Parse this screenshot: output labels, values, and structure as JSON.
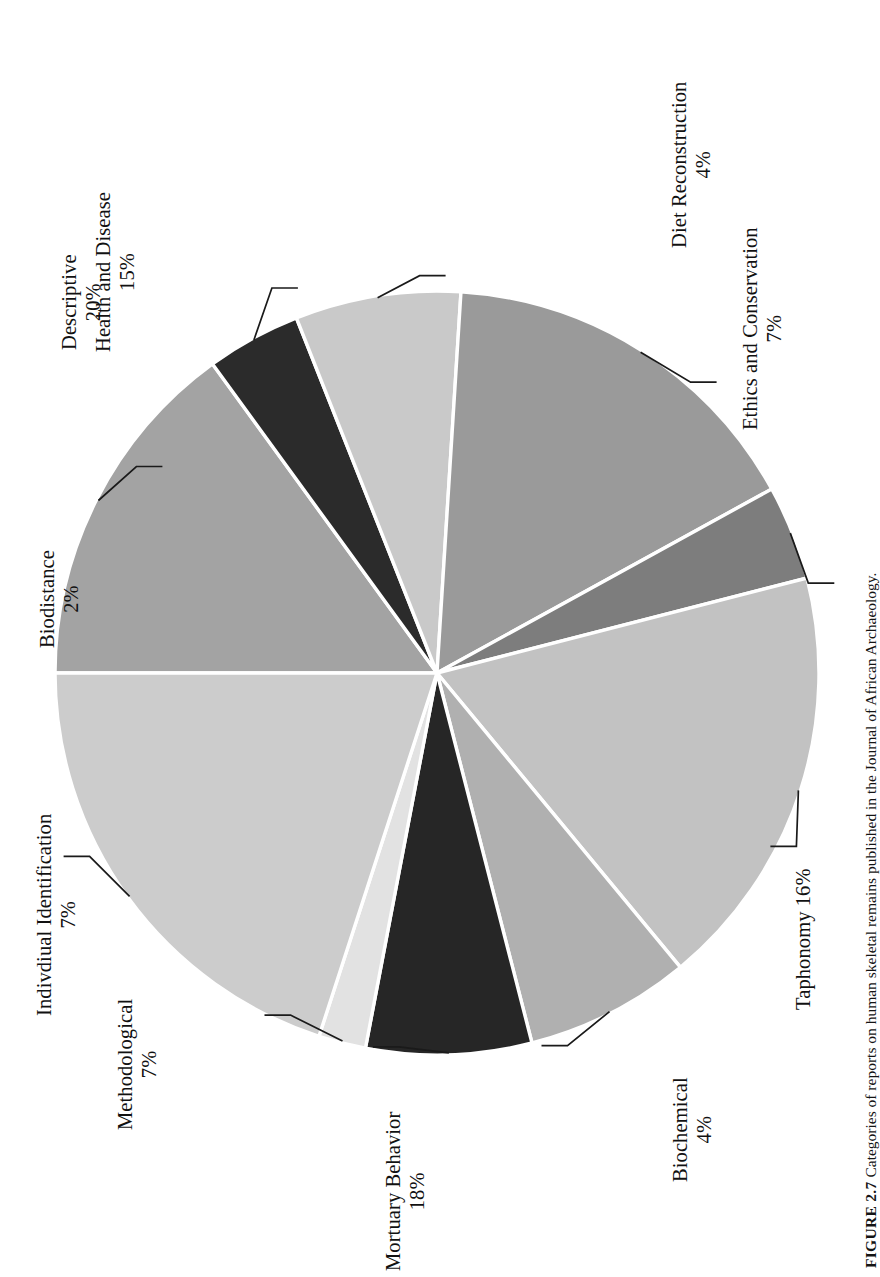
{
  "figure": {
    "caption_label": "FIGURE 2.7",
    "caption_text": "Categories of reports on human skeletal remains published in the Journal of African Archaeology."
  },
  "chart_data": {
    "type": "pie",
    "title": "",
    "orientation_degrees": -90,
    "separator_color": "#ffffff",
    "legend": "none (direct labels with leader lines)",
    "categories": [
      "Health and Disease",
      "Diet Reconstruction",
      "Ethics and Conservation",
      "Taphonomy",
      "Biochemical",
      "Mortuary Behavior",
      "Methodological",
      "Indivdiual Identification",
      "Biodistance",
      "Descriptive"
    ],
    "values": [
      15,
      4,
      7,
      16,
      4,
      18,
      7,
      7,
      2,
      20
    ],
    "value_labels": [
      "15%",
      "4%",
      "7%",
      "16%",
      "4%",
      "18%",
      "7%",
      "7%",
      "2%",
      "20%"
    ],
    "colors": [
      "#a3a3a3",
      "#2b2b2b",
      "#c9c9c9",
      "#9a9a9a",
      "#7d7d7d",
      "#c2c2c2",
      "#b0b0b0",
      "#262626",
      "#e2e2e2",
      "#cccccc"
    ],
    "slices": [
      {
        "label": "Health and Disease",
        "value": 15,
        "pct": "15%",
        "color": "#a3a3a3"
      },
      {
        "label": "Diet Reconstruction",
        "value": 4,
        "pct": "4%",
        "color": "#2b2b2b"
      },
      {
        "label": "Ethics and Conservation",
        "value": 7,
        "pct": "7%",
        "color": "#c9c9c9"
      },
      {
        "label": "Taphonomy",
        "value": 16,
        "pct": "16%",
        "color": "#9a9a9a"
      },
      {
        "label": "Biochemical",
        "value": 4,
        "pct": "4%",
        "color": "#7d7d7d"
      },
      {
        "label": "Mortuary Behavior",
        "value": 18,
        "pct": "18%",
        "color": "#c2c2c2"
      },
      {
        "label": "Methodological",
        "value": 7,
        "pct": "7%",
        "color": "#b0b0b0"
      },
      {
        "label": "Indivdiual Identification",
        "value": 7,
        "pct": "7%",
        "color": "#262626"
      },
      {
        "label": "Biodistance",
        "value": 2,
        "pct": "2%",
        "color": "#e2e2e2"
      },
      {
        "label": "Descriptive",
        "value": 20,
        "pct": "20%",
        "color": "#cccccc"
      }
    ],
    "total": 100
  },
  "labels": {
    "health": {
      "line1": "Health and Disease",
      "line2": "15%"
    },
    "diet": {
      "line1": "Diet Reconstruction",
      "line2": "4%"
    },
    "ethics": {
      "line1": "Ethics and Conservation",
      "line2": "7%"
    },
    "taphonomy": {
      "line1": "Taphonomy 16%",
      "line2": ""
    },
    "biochemical": {
      "line1": "Biochemical",
      "line2": "4%"
    },
    "mortuary": {
      "line1": "Mortuary Behavior",
      "line2": "18%"
    },
    "methodological": {
      "line1": "Methodological",
      "line2": "7%"
    },
    "individual": {
      "line1": "Indivdiual Identification",
      "line2": "7%"
    },
    "biodistance": {
      "line1": "Biodistance",
      "line2": "2%"
    },
    "descriptive": {
      "line1": "Descriptive",
      "line2": "20%"
    }
  }
}
